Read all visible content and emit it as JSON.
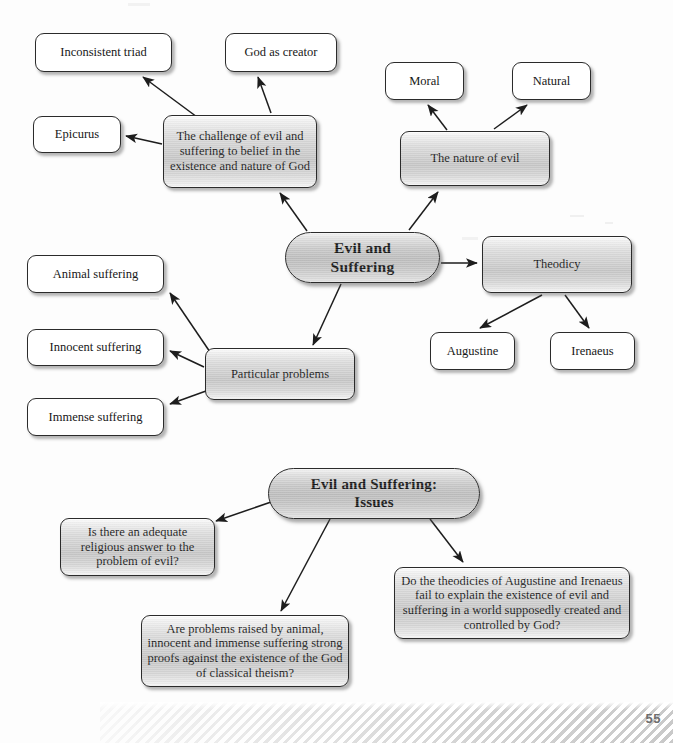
{
  "page": {
    "page_number": "55",
    "background_color": "#fdfdfd",
    "ink_color": "#171717"
  },
  "diagrams": [
    {
      "id": "evil-and-suffering-map",
      "center": "Evil and\nSuffering",
      "nodes": [
        {
          "id": "inconsistent-triad",
          "label": "Inconsistent triad",
          "style": "plain"
        },
        {
          "id": "god-as-creator",
          "label": "God as creator",
          "style": "plain"
        },
        {
          "id": "epicurus",
          "label": "Epicurus",
          "style": "plain"
        },
        {
          "id": "challenge-of-evil",
          "label": "The challenge of evil and suffering to belief in the existence and nature of God",
          "style": "metal"
        },
        {
          "id": "moral",
          "label": "Moral",
          "style": "plain"
        },
        {
          "id": "natural",
          "label": "Natural",
          "style": "plain"
        },
        {
          "id": "nature-of-evil",
          "label": "The nature of evil",
          "style": "metal"
        },
        {
          "id": "theodicy",
          "label": "Theodicy",
          "style": "metal"
        },
        {
          "id": "augustine",
          "label": "Augustine",
          "style": "plain"
        },
        {
          "id": "irenaeus",
          "label": "Irenaeus",
          "style": "plain"
        },
        {
          "id": "particular-problems",
          "label": "Particular problems",
          "style": "metal"
        },
        {
          "id": "animal-suffering",
          "label": "Animal suffering",
          "style": "plain"
        },
        {
          "id": "innocent-suffering",
          "label": "Innocent suffering",
          "style": "plain"
        },
        {
          "id": "immense-suffering",
          "label": "Immense suffering",
          "style": "plain"
        }
      ]
    },
    {
      "id": "evil-and-suffering-issues-map",
      "center": "Evil and Suffering:\nIssues",
      "nodes": [
        {
          "id": "issue-adequate-answer",
          "label": "Is there an adequate religious answer to the problem of evil?",
          "style": "metal"
        },
        {
          "id": "issue-strong-proofs",
          "label": "Are problems raised by animal, innocent and immense suffering strong proofs against the existence of the God of classical theism?",
          "style": "metal"
        },
        {
          "id": "issue-theodicies-fail",
          "label": "Do the theodicies of Augustine and Irenaeus fail to explain the existence of evil and suffering in a world supposedly created and controlled by God?",
          "style": "metal"
        }
      ]
    }
  ],
  "labels": {
    "center_top_line1": "Evil and",
    "center_top_line2": "Suffering",
    "center_bottom_line1": "Evil and Suffering:",
    "center_bottom_line2": "Issues",
    "inconsistent_triad": "Inconsistent triad",
    "god_as_creator": "God as creator",
    "epicurus": "Epicurus",
    "challenge_of_evil": "The challenge of evil and suffering to belief in the existence and nature of God",
    "moral": "Moral",
    "natural": "Natural",
    "nature_of_evil": "The nature of evil",
    "theodicy": "Theodicy",
    "augustine": "Augustine",
    "irenaeus": "Irenaeus",
    "particular_problems": "Particular problems",
    "animal_suffering": "Animal suffering",
    "innocent_suffering": "Innocent suffering",
    "immense_suffering": "Immense suffering",
    "issue_adequate_answer": "Is there an adequate religious answer to the problem of evil?",
    "issue_strong_proofs": "Are problems raised by animal, innocent and immense suffering strong proofs against the existence of the God of classical theism?",
    "issue_theodicies_fail": "Do the theodicies of Augustine and Irenaeus fail to explain the existence of evil and suffering in a world supposedly created and controlled by God?"
  },
  "connections": [
    {
      "from": "challenge-of-evil",
      "to": "inconsistent-triad"
    },
    {
      "from": "challenge-of-evil",
      "to": "god-as-creator"
    },
    {
      "from": "challenge-of-evil",
      "to": "epicurus"
    },
    {
      "from": "evil-and-suffering",
      "to": "challenge-of-evil"
    },
    {
      "from": "evil-and-suffering",
      "to": "nature-of-evil"
    },
    {
      "from": "nature-of-evil",
      "to": "moral"
    },
    {
      "from": "nature-of-evil",
      "to": "natural"
    },
    {
      "from": "evil-and-suffering",
      "to": "theodicy"
    },
    {
      "from": "theodicy",
      "to": "augustine"
    },
    {
      "from": "theodicy",
      "to": "irenaeus"
    },
    {
      "from": "evil-and-suffering",
      "to": "particular-problems"
    },
    {
      "from": "particular-problems",
      "to": "animal-suffering"
    },
    {
      "from": "particular-problems",
      "to": "innocent-suffering"
    },
    {
      "from": "particular-problems",
      "to": "immense-suffering"
    },
    {
      "from": "issues-center",
      "to": "issue-adequate-answer"
    },
    {
      "from": "issues-center",
      "to": "issue-strong-proofs"
    },
    {
      "from": "issues-center",
      "to": "issue-theodicies-fail"
    }
  ]
}
